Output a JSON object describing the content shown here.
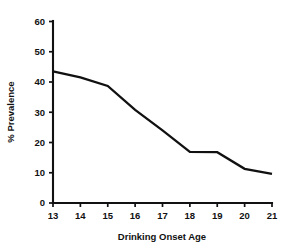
{
  "chart_data": {
    "type": "line",
    "title": "",
    "subtitle": "",
    "xlabel": "Drinking Onset Age",
    "ylabel": "% Prevalence",
    "x": [
      13,
      14,
      15,
      16,
      17,
      18,
      19,
      20,
      21
    ],
    "categories": [
      "13",
      "14",
      "15",
      "16",
      "17",
      "18",
      "19",
      "20",
      "21"
    ],
    "values": [
      43.5,
      41.5,
      38.7,
      30.8,
      24.0,
      16.9,
      16.8,
      11.3,
      9.6
    ],
    "series": [
      {
        "name": "% Prevalence",
        "values": [
          43.5,
          41.5,
          38.7,
          30.8,
          24.0,
          16.9,
          16.8,
          11.3,
          9.6
        ],
        "color": "#111111"
      }
    ],
    "xlim": [
      13,
      21
    ],
    "ylim": [
      0,
      60
    ],
    "ytick_labels": [
      "0",
      "10",
      "20",
      "30",
      "40",
      "50",
      "60"
    ],
    "yticks": [
      0,
      10,
      20,
      30,
      40,
      50,
      60
    ],
    "xtick_labels": [
      "13",
      "14",
      "15",
      "16",
      "17",
      "18",
      "19",
      "20",
      "21"
    ],
    "xticks": [
      13,
      14,
      15,
      16,
      17,
      18,
      19,
      20,
      21
    ],
    "grid": false,
    "legend": false,
    "legend_position": "none",
    "markers": false,
    "line_color": "#111111",
    "background_color": "#ffffff",
    "annotations": []
  }
}
